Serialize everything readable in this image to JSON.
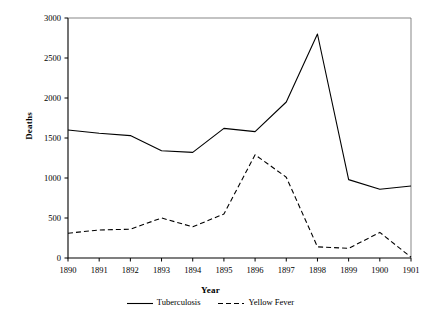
{
  "chart_data": {
    "type": "line",
    "title": "",
    "xlabel": "Year",
    "ylabel": "Deaths",
    "x": [
      1890,
      1891,
      1892,
      1893,
      1894,
      1895,
      1896,
      1897,
      1898,
      1899,
      1900,
      1901
    ],
    "xticklabels": [
      "1890",
      "1891",
      "1892",
      "1893",
      "1894",
      "1895",
      "1896",
      "1897",
      "1898",
      "1899",
      "1900",
      "1901"
    ],
    "yticks": [
      0,
      500,
      1000,
      1500,
      2000,
      2500,
      3000
    ],
    "yticklabels": [
      "0",
      "500",
      "1000",
      "1500",
      "2000",
      "2500",
      "3000"
    ],
    "ylim": [
      0,
      3000
    ],
    "xlim": [
      1890,
      1901
    ],
    "grid": false,
    "legend_position": "bottom",
    "series": [
      {
        "name": "Tuberculosis",
        "style": "solid",
        "color": "#000000",
        "values": [
          1600,
          1560,
          1530,
          1340,
          1320,
          1620,
          1580,
          1950,
          2800,
          980,
          860,
          900
        ]
      },
      {
        "name": "Yellow Fever",
        "style": "dashed",
        "color": "#000000",
        "values": [
          310,
          350,
          360,
          500,
          390,
          550,
          1290,
          1010,
          140,
          120,
          320,
          10
        ]
      }
    ]
  },
  "axes": {
    "y_title": "Deaths",
    "x_title": "Year"
  },
  "legend": {
    "items": [
      {
        "label": "Tuberculosis"
      },
      {
        "label": "Yellow Fever"
      }
    ]
  }
}
